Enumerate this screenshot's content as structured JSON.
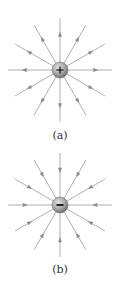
{
  "diagrams": [
    {
      "id": "a",
      "label": "(a)",
      "charge_sign": "+",
      "charge_type": "positive",
      "field_direction": "outward",
      "center": [
        60,
        70
      ],
      "line_count": 12,
      "line_length": 52
    },
    {
      "id": "b",
      "label": "(b)",
      "charge_sign": "−",
      "charge_type": "negative",
      "field_direction": "inward",
      "center": [
        60,
        205
      ],
      "line_count": 12,
      "line_length": 52
    }
  ],
  "colors": {
    "field_line": "#9a9a9a",
    "arrow": "#8a8a8a",
    "sphere_light": "#d6d6d6",
    "sphere_dark": "#7a7a7a",
    "sign": "#222222",
    "background": "#ffffff"
  }
}
